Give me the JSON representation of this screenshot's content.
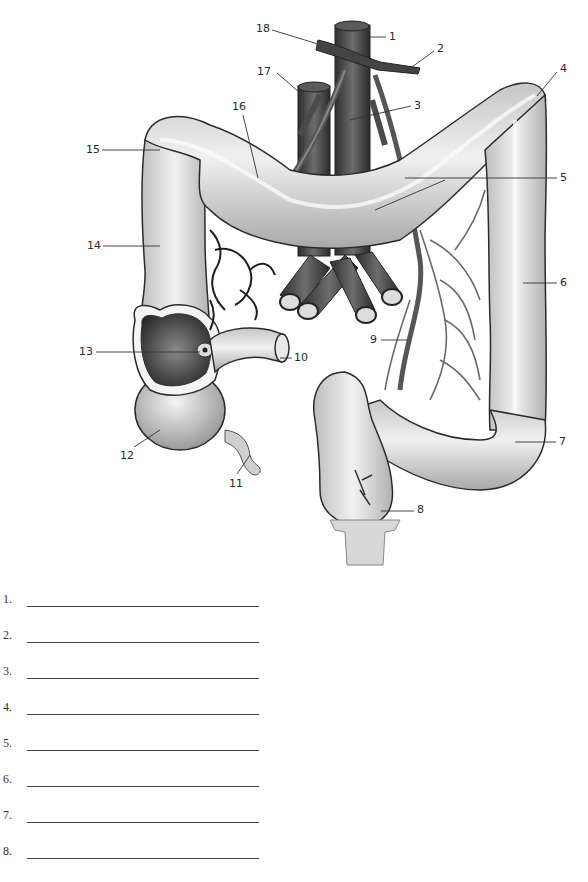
{
  "worksheet": {
    "subject": "Large intestine with associated blood vessels (labeling exercise)",
    "callouts": [
      {
        "number": "1",
        "x": 389,
        "y": 31
      },
      {
        "number": "2",
        "x": 437,
        "y": 43
      },
      {
        "number": "3",
        "x": 414,
        "y": 102
      },
      {
        "number": "4",
        "x": 560,
        "y": 64
      },
      {
        "number": "5",
        "x": 560,
        "y": 173
      },
      {
        "number": "6",
        "x": 560,
        "y": 278
      },
      {
        "number": "7",
        "x": 559,
        "y": 437
      },
      {
        "number": "8",
        "x": 417,
        "y": 504
      },
      {
        "number": "9",
        "x": 370,
        "y": 334
      },
      {
        "number": "10",
        "x": 294,
        "y": 353
      },
      {
        "number": "11",
        "x": 229,
        "y": 478
      },
      {
        "number": "12",
        "x": 120,
        "y": 450
      },
      {
        "number": "13",
        "x": 79,
        "y": 347
      },
      {
        "number": "14",
        "x": 87,
        "y": 241
      },
      {
        "number": "15",
        "x": 86,
        "y": 145
      },
      {
        "number": "16",
        "x": 232,
        "y": 102
      },
      {
        "number": "17",
        "x": 257,
        "y": 67
      },
      {
        "number": "18",
        "x": 256,
        "y": 24
      }
    ],
    "answer_lines": {
      "left_column": [
        "1.",
        "2.",
        "3.",
        "4.",
        "5.",
        "6.",
        "7.",
        "8.",
        "9."
      ],
      "right_column": [
        "10.",
        "11.",
        "12.",
        "13.",
        "14.",
        "15.",
        "16.",
        "17.",
        "18."
      ],
      "values": [
        "",
        "",
        "",
        "",
        "",
        "",
        "",
        "",
        "",
        "",
        "",
        "",
        "",
        "",
        "",
        "",
        "",
        ""
      ]
    }
  },
  "colors": {
    "background": "#ffffff",
    "colon_fill": "#d9d9d9",
    "colon_outline": "#2b2b2b",
    "vessel_dark": "#3d3d3d",
    "vessel_mid": "#6e6e6e",
    "text": "#2a2a2a",
    "rule": "#444444"
  }
}
